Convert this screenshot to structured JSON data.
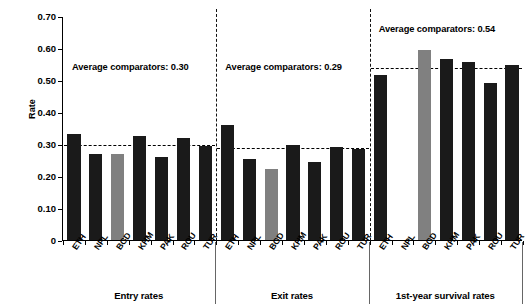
{
  "chart_data": {
    "type": "bar",
    "title": "",
    "xlabel": "",
    "ylabel": "Rate",
    "ylim": [
      0,
      0.7
    ],
    "ytick_labels": [
      "0",
      "0.10",
      "0.20",
      "0.30",
      "0.40",
      "0.50",
      "0.60",
      "0.70"
    ],
    "ytick_values": [
      0,
      0.1,
      0.2,
      0.3,
      0.4,
      0.5,
      0.6,
      0.7
    ],
    "grid": false,
    "legend": "none",
    "categories": [
      "ETH",
      "NPL",
      "BGD",
      "KHM",
      "PAK",
      "ROU",
      "TUR"
    ],
    "panels": [
      {
        "name": "Entry rates",
        "annotation": "Average comparators: 0.30",
        "average_comparators": 0.3,
        "values": [
          0.33,
          0.27,
          0.268,
          0.325,
          0.26,
          0.32,
          0.295
        ],
        "highlight_category": "BGD"
      },
      {
        "name": "Exit rates",
        "annotation": "Average comparators: 0.29",
        "average_comparators": 0.29,
        "values": [
          0.36,
          0.252,
          0.222,
          0.297,
          0.245,
          0.292,
          0.285
        ],
        "highlight_category": "BGD"
      },
      {
        "name": "1st-year survival rates",
        "annotation": "Average comparators: 0.54",
        "average_comparators": 0.54,
        "values": [
          0.515,
          null,
          0.595,
          0.565,
          0.555,
          0.492,
          0.547
        ],
        "highlight_category": "BGD"
      }
    ],
    "colors": {
      "bar_default": "#1a1a1a",
      "bar_highlight": "#808080",
      "axis": "#000000",
      "reference_line": "#000000"
    }
  }
}
